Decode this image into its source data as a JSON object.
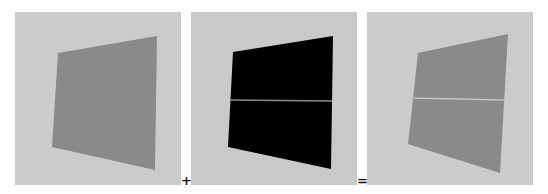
{
  "equation": {
    "operators": {
      "plus": "+",
      "equals": "="
    },
    "panels": [
      {
        "id": "source-texture",
        "description": "Gray textured quadrilateral on light gray background",
        "background_color": "#cbcbcb",
        "quad_color": "#8e8e8e",
        "has_seam": false
      },
      {
        "id": "mask",
        "description": "Black quadrilateral with horizontal gray seam line",
        "background_color": "#c9c9c9",
        "quad_color": "#000000",
        "has_seam": true,
        "seam_color": "#8a8a8a"
      },
      {
        "id": "result",
        "description": "Gray textured quadrilateral with light horizontal seam line",
        "background_color": "#cbcbcb",
        "quad_color": "#8e8e8e",
        "has_seam": true,
        "seam_color": "#c4c4c4"
      }
    ]
  }
}
